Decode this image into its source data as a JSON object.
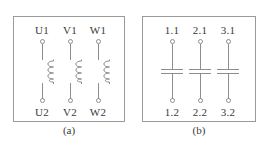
{
  "figure": {
    "background_color": "#ffffff",
    "line_color": "#8d8d8d",
    "text_color": "#3a3a3a"
  },
  "panels": [
    {
      "id": "a",
      "caption": "(a)",
      "symbol_type": "coil",
      "branches": [
        {
          "top_label": "U1",
          "bottom_label": "U2"
        },
        {
          "top_label": "V1",
          "bottom_label": "V2"
        },
        {
          "top_label": "W1",
          "bottom_label": "W2"
        }
      ]
    },
    {
      "id": "b",
      "caption": "(b)",
      "symbol_type": "capacitor",
      "branches": [
        {
          "top_label": "1.1",
          "bottom_label": "1.2"
        },
        {
          "top_label": "2.1",
          "bottom_label": "2.2"
        },
        {
          "top_label": "3.1",
          "bottom_label": "3.2"
        }
      ]
    }
  ]
}
